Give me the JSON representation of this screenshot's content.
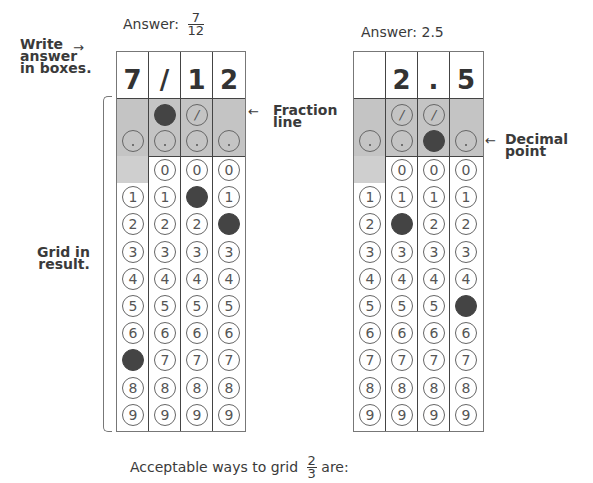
{
  "left": {
    "title_prefix": "Answer:",
    "fraction": {
      "num": "7",
      "den": "12"
    },
    "boxes": [
      "7",
      "/",
      "1",
      "2"
    ],
    "filled": [
      {
        "col": 0,
        "row": "7"
      },
      {
        "col": 1,
        "row": "slash"
      },
      {
        "col": 2,
        "row": "1"
      },
      {
        "col": 3,
        "row": "2"
      }
    ]
  },
  "right": {
    "title": "Answer: 2.5",
    "boxes": [
      "",
      "2",
      ".",
      "5"
    ],
    "filled": [
      {
        "col": 1,
        "row": "2"
      },
      {
        "col": 2,
        "row": "decimal"
      },
      {
        "col": 3,
        "row": "5"
      }
    ]
  },
  "annotations": {
    "write_answer": [
      "Write",
      "answer",
      "in boxes."
    ],
    "grid_in": [
      "Grid in",
      "result."
    ],
    "fraction_line": [
      "Fraction",
      "line"
    ],
    "decimal_point": [
      "Decimal",
      "point"
    ],
    "arrow": "←",
    "arrow_right": "→"
  },
  "footer": {
    "text_prefix": "Acceptable ways to grid",
    "fraction": {
      "num": "2",
      "den": "3"
    },
    "text_suffix": "are:"
  },
  "digits": [
    "0",
    "1",
    "2",
    "3",
    "4",
    "5",
    "6",
    "7",
    "8",
    "9"
  ],
  "colors": {
    "filled": "#444444",
    "shade": "#c4c4c4",
    "text": "#3a3a3a"
  }
}
